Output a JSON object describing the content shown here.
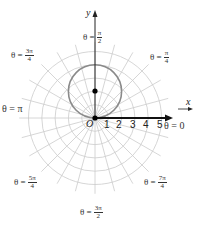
{
  "chart_data": {
    "type": "polar",
    "title": "",
    "curve": {
      "equation": "r = 4 sin θ",
      "shape": "circle",
      "center_cartesian": [
        0,
        2
      ],
      "radius": 2,
      "color": "#888888"
    },
    "center_point": {
      "x": 0,
      "y": 2,
      "marker": "filled-dot"
    },
    "pole_point": {
      "x": 0,
      "y": 0,
      "marker": "filled-dot"
    },
    "polar_axis": {
      "from": 0,
      "to": 5.8,
      "arrow": true
    },
    "radial_ticks": [
      1,
      2,
      3,
      4,
      5
    ],
    "grid": {
      "circle_step": 1,
      "max_radius": 5.7,
      "ray_step_deg": 15,
      "color": "#cccccc"
    },
    "angle_labels": [
      {
        "theta": "0",
        "num": "",
        "den": "",
        "prefix": "θ = 0"
      },
      {
        "theta": "π/4",
        "num": "π",
        "den": "4",
        "prefix": "θ ="
      },
      {
        "theta": "π/2",
        "num": "π",
        "den": "2",
        "prefix": "θ ="
      },
      {
        "theta": "3π/4",
        "num": "3π",
        "den": "4",
        "prefix": "θ ="
      },
      {
        "theta": "π",
        "num": "",
        "den": "",
        "prefix": "θ = π"
      },
      {
        "theta": "5π/4",
        "num": "5π",
        "den": "4",
        "prefix": "θ ="
      },
      {
        "theta": "3π/2",
        "num": "3π",
        "den": "2",
        "prefix": "θ ="
      },
      {
        "theta": "7π/4",
        "num": "7π",
        "den": "4",
        "prefix": "θ ="
      }
    ],
    "xlabel": "x",
    "ylabel": "y",
    "origin_label": "O"
  },
  "labels": {
    "x": "x",
    "y": "y",
    "origin": "O",
    "ticks": [
      "1",
      "2",
      "3",
      "4",
      "5"
    ],
    "t0": "θ = 0",
    "tpi": "θ = π",
    "eq": "θ =",
    "pi4": {
      "num": "π",
      "den": "4"
    },
    "pi2": {
      "num": "π",
      "den": "2"
    },
    "p3pi4": {
      "num": "3π",
      "den": "4"
    },
    "p5pi4": {
      "num": "5π",
      "den": "4"
    },
    "p3pi2": {
      "num": "3π",
      "den": "2"
    },
    "p7pi4": {
      "num": "7π",
      "den": "4"
    }
  }
}
